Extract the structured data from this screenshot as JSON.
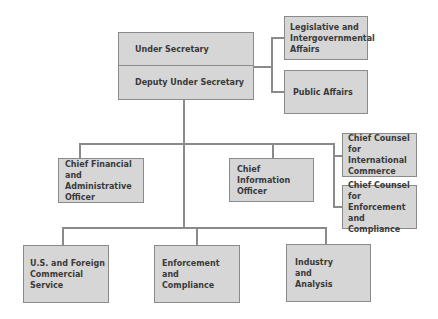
{
  "org_chart": {
    "top": {
      "under_secretary": "Under Secretary",
      "deputy_under_secretary": "Deputy Under Secretary"
    },
    "staff_right": [
      "Legislative and Intergovernmental Affairs",
      "Public Affairs"
    ],
    "middle": {
      "cfo": "Chief Financial and Administrative Officer",
      "cio": "Chief Information Officer",
      "counsel": [
        "Chief Counsel for International Commerce",
        "Chief Counsel for Enforcement and Compliance"
      ]
    },
    "units": [
      "U.S. and Foreign Commercial Service",
      "Enforcement and Compliance",
      "Industry and Analysis"
    ]
  }
}
